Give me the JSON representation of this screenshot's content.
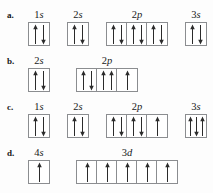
{
  "figure": {
    "background_color": "#fdfdfd",
    "box_border_color": "#8b8d90",
    "arrow_color": "#2b2b2b"
  },
  "rows": [
    {
      "letter": "a.",
      "groups": [
        {
          "label_n": "1",
          "label_l": "s",
          "orbitals": [
            {
              "arrows": [
                "up",
                "down"
              ]
            }
          ]
        },
        {
          "label_n": "2",
          "label_l": "s",
          "orbitals": [
            {
              "arrows": [
                "up",
                "down"
              ]
            }
          ]
        },
        {
          "label_n": "2",
          "label_l": "p",
          "orbitals": [
            {
              "arrows": [
                "up",
                "down"
              ]
            },
            {
              "arrows": [
                "up",
                "down"
              ]
            },
            {
              "arrows": [
                "up",
                "down"
              ]
            }
          ]
        },
        {
          "label_n": "3",
          "label_l": "s",
          "orbitals": [
            {
              "arrows": [
                "up",
                "down"
              ]
            }
          ]
        }
      ]
    },
    {
      "letter": "b.",
      "groups": [
        {
          "label_n": "2",
          "label_l": "s",
          "orbitals": [
            {
              "arrows": [
                "up",
                "down"
              ]
            }
          ]
        },
        {
          "label_n": "2",
          "label_l": "p",
          "orbitals": [
            {
              "arrows": [
                "up",
                "down"
              ]
            },
            {
              "arrows": [
                "up",
                "up"
              ]
            },
            {
              "arrows": [
                "up"
              ]
            }
          ]
        }
      ]
    },
    {
      "letter": "c.",
      "groups": [
        {
          "label_n": "1",
          "label_l": "s",
          "orbitals": [
            {
              "arrows": [
                "up",
                "down"
              ]
            }
          ]
        },
        {
          "label_n": "2",
          "label_l": "s",
          "orbitals": [
            {
              "arrows": [
                "up",
                "down"
              ]
            }
          ]
        },
        {
          "label_n": "2",
          "label_l": "p",
          "orbitals": [
            {
              "arrows": [
                "up",
                "down"
              ]
            },
            {
              "arrows": [
                "up",
                "down"
              ]
            },
            {
              "arrows": [
                "up"
              ]
            }
          ]
        },
        {
          "label_n": "3",
          "label_l": "s",
          "orbitals": [
            {
              "arrows": [
                "up",
                "down",
                "up"
              ]
            }
          ]
        }
      ]
    },
    {
      "letter": "d.",
      "groups": [
        {
          "label_n": "4",
          "label_l": "s",
          "orbitals": [
            {
              "arrows": [
                "up"
              ]
            }
          ]
        },
        {
          "label_n": "3",
          "label_l": "d",
          "orbitals": [
            {
              "arrows": [
                "up"
              ]
            },
            {
              "arrows": [
                "up"
              ]
            },
            {
              "arrows": [
                "up"
              ]
            },
            {
              "arrows": [
                "up"
              ]
            },
            {
              "arrows": [
                "up"
              ]
            }
          ]
        }
      ]
    }
  ]
}
